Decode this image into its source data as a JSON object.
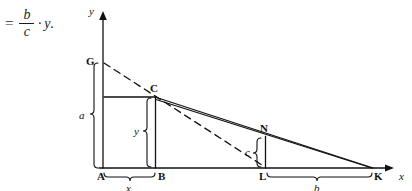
{
  "page": {
    "cut_text_top": "",
    "background": "#ffffff",
    "ink": "#111111"
  },
  "formula": {
    "equals": "=",
    "numerator": "b",
    "denominator": "c",
    "operator": "·",
    "variable": "y",
    "period": "."
  },
  "diagram": {
    "axes": {
      "y_label": "y",
      "x_label": "x",
      "origin_label": "A"
    },
    "points": [
      {
        "name": "G",
        "label": "G",
        "x": 103,
        "y": 63
      },
      {
        "name": "C",
        "label": "C",
        "x": 155,
        "y": 97
      },
      {
        "name": "N",
        "label": "N",
        "x": 265,
        "y": 137
      },
      {
        "name": "A",
        "label": "A",
        "x": 103,
        "y": 168
      },
      {
        "name": "B",
        "label": "B",
        "x": 155,
        "y": 168
      },
      {
        "name": "L",
        "label": "L",
        "x": 265,
        "y": 168
      },
      {
        "name": "K",
        "label": "K",
        "x": 373,
        "y": 168
      }
    ],
    "braces": [
      {
        "name": "a",
        "label": "a",
        "orientation": "vertical",
        "from": "A",
        "to": "G"
      },
      {
        "name": "y",
        "label": "y",
        "orientation": "vertical",
        "from": "B",
        "to": "C"
      },
      {
        "name": "c",
        "label": "c",
        "orientation": "vertical",
        "from": "L",
        "to": "N"
      },
      {
        "name": "x",
        "label": "x",
        "orientation": "horizontal",
        "from": "A",
        "to": "B"
      },
      {
        "name": "b",
        "label": "b",
        "orientation": "horizontal",
        "from": "L",
        "to": "K"
      }
    ],
    "segments": [
      {
        "name": "y-axis",
        "style": "solid",
        "arrow": true
      },
      {
        "name": "x-axis",
        "style": "solid",
        "arrow": true
      },
      {
        "name": "hypotenuse-C-to-K",
        "style": "solid"
      },
      {
        "name": "dashed-G-to-L",
        "style": "dashed"
      },
      {
        "name": "horizontal-axis-to-C",
        "style": "solid"
      },
      {
        "name": "vertical-B-to-C",
        "style": "solid"
      },
      {
        "name": "vertical-L-to-N",
        "style": "solid"
      }
    ]
  }
}
